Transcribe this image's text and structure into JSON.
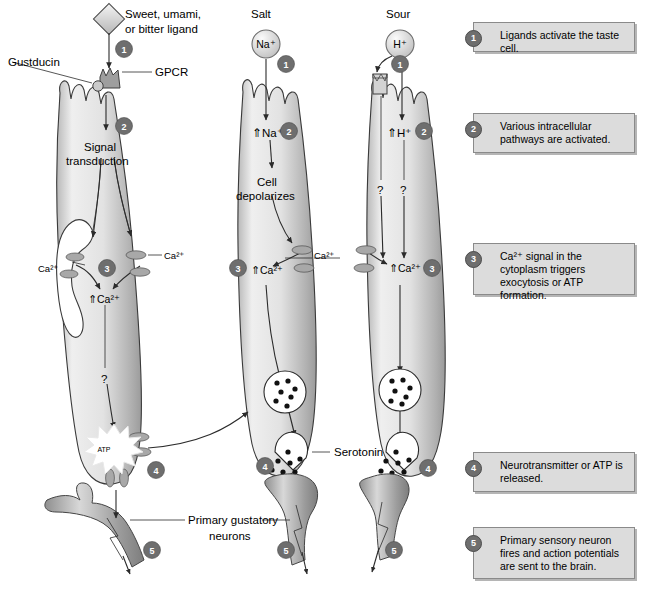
{
  "figure": {
    "background": "#ffffff",
    "badge_color": "#6e6e6e",
    "cell_fill_light": "#f2f2f2",
    "cell_fill_dark": "#a9a9a9",
    "note_fill": "#dcdcdc"
  },
  "pathways": {
    "sweet": {
      "stimulus_label": "Sweet, umami,",
      "stimulus_label_2": "or bitter ligand",
      "receptor_label": "GPCR",
      "gprotein_label": "Gustducin",
      "step2_label_1": "Signal",
      "step2_label_2": "transduction",
      "er_calcium_label": "Ca²⁺",
      "membrane_calcium_label": "Ca²⁺",
      "calcium_rise_label": "⇑Ca²⁺",
      "unknown_label": "?",
      "transmitter_label": "ATP",
      "steps": [
        "1",
        "2",
        "3",
        "4",
        "5"
      ]
    },
    "salt": {
      "stimulus_label": "Salt",
      "ion_label": "Na⁺",
      "ion_rise_label": "⇑Na⁺",
      "step2_label_1": "Cell",
      "step2_label_2": "depolarizes",
      "membrane_calcium_label": "Ca²⁺",
      "calcium_rise_label": "⇑Ca²⁺",
      "transmitter_label": "Serotonin",
      "steps": [
        "1",
        "2",
        "3",
        "4",
        "5"
      ]
    },
    "sour": {
      "stimulus_label": "Sour",
      "ion_label": "H⁺",
      "ion_rise_label": "⇑H⁺",
      "unknown_label_left": "?",
      "unknown_label_right": "?",
      "calcium_rise_label": "⇑Ca²⁺",
      "steps": [
        "1",
        "2",
        "3",
        "4",
        "5"
      ]
    }
  },
  "shared_labels": {
    "neuron_label_1": "Primary gustatory",
    "neuron_label_2": "neurons"
  },
  "notes": [
    {
      "num": "1",
      "text": "Ligands activate the taste cell."
    },
    {
      "num": "2",
      "text": "Various intracellular pathways are activated."
    },
    {
      "num": "3",
      "text": "Ca²⁺ signal in the cytoplasm triggers exocytosis or ATP formation."
    },
    {
      "num": "4",
      "text": "Neurotransmitter or ATP is released."
    },
    {
      "num": "5",
      "text": "Primary sensory neuron fires and action potentials are sent to the brain."
    }
  ]
}
